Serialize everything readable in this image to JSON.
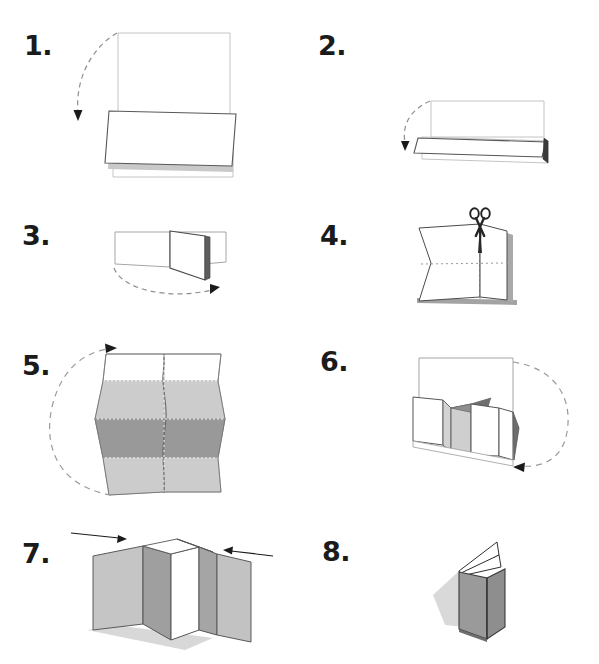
{
  "document": {
    "kind": "illustrated-instruction-sheet",
    "title": "Paper folding instructions",
    "subject": "folded-book-from-single-sheet",
    "background_color": "#ffffff",
    "total_steps": 8,
    "columns": 2,
    "rows": 4
  },
  "palette": {
    "ink": "#1b1b1b",
    "outline": "#4a4a4a",
    "outline_light": "#9b9b9b",
    "paper_face": "#ffffff",
    "paper_light_gray": "#cccccc",
    "paper_mid_gray": "#b0b0b0",
    "paper_dark_gray": "#999999",
    "paper_shadow_gray": "#8c8c8c",
    "drop_shadow": "#c8c8c8",
    "fold_line": "#9a9a9a",
    "arrow": "#5a5a5a",
    "arrow_solid": "#1b1b1b"
  },
  "steps": [
    {
      "number": "1.",
      "number_position": {
        "x": 24,
        "y": 32
      },
      "figure_position": {
        "x": 60,
        "y": 22
      },
      "action": "fold-sheet-in-half-downward",
      "description": "Fold the upright sheet forward and down along the horizontal middle.",
      "arrow": {
        "type": "curved-dashed",
        "direction": "down-left",
        "style": "dashed"
      },
      "icons": [
        "curved-fold-arrow-icon",
        "paper-sheet-icon"
      ]
    },
    {
      "number": "2.",
      "number_position": {
        "x": 318,
        "y": 32
      },
      "figure_position": {
        "x": 360,
        "y": 22
      },
      "action": "fold-in-half-downward-again",
      "description": "Fold the resulting rectangle forward and down in half again.",
      "arrow": {
        "type": "curved-dashed",
        "direction": "down-left",
        "style": "dashed"
      },
      "icons": [
        "curved-fold-arrow-icon",
        "paper-sheet-icon"
      ]
    },
    {
      "number": "3.",
      "number_position": {
        "x": 22,
        "y": 222
      },
      "figure_position": {
        "x": 60,
        "y": 210
      },
      "action": "fold-right-half-to-the-right",
      "description": "Fold the standing half over sideways to the right.",
      "arrow": {
        "type": "curved-dashed",
        "direction": "right",
        "style": "dashed"
      },
      "icons": [
        "curved-fold-arrow-icon",
        "paper-sheet-icon"
      ]
    },
    {
      "number": "4.",
      "number_position": {
        "x": 320,
        "y": 222
      },
      "figure_position": {
        "x": 360,
        "y": 210
      },
      "action": "cut-along-center-fold",
      "description": "Unfold part way and cut along the centre crease with scissors.",
      "arrow": {
        "type": "none"
      },
      "fold_lines": "dotted crease lines along horizontal middle and vertical middle",
      "icons": [
        "scissors-icon",
        "dotted-fold-line-icon",
        "paper-sheet-icon"
      ]
    },
    {
      "number": "5.",
      "number_position": {
        "x": 22,
        "y": 352
      },
      "figure_position": {
        "x": 55,
        "y": 338
      },
      "action": "open-into-accordion-pleats",
      "description": "Open the cut sheet out into an accordion of pleats and rotate it.",
      "arrow": {
        "type": "curved-dashed-large",
        "direction": "counter-clockwise-up",
        "style": "dashed"
      },
      "icons": [
        "curved-rotate-arrow-icon",
        "accordion-pleat-icon"
      ]
    },
    {
      "number": "6.",
      "number_position": {
        "x": 320,
        "y": 348
      },
      "figure_position": {
        "x": 345,
        "y": 335
      },
      "action": "rotate-and-stand-pleats-upright",
      "description": "Stand the pleated paper up and swing it around.",
      "arrow": {
        "type": "curved-dashed-large",
        "direction": "clockwise-down",
        "style": "dashed"
      },
      "icons": [
        "curved-rotate-arrow-icon",
        "pleated-paper-icon"
      ]
    },
    {
      "number": "7.",
      "number_position": {
        "x": 22,
        "y": 540
      },
      "figure_position": {
        "x": 70,
        "y": 522
      },
      "action": "push-outer-panels-together",
      "description": "Push the two outer panels toward each other to close the pleats.",
      "arrow": {
        "type": "straight-pair",
        "direction": "inward",
        "style": "solid"
      },
      "icons": [
        "arrow-right-icon",
        "arrow-left-icon",
        "standing-pleats-icon"
      ]
    },
    {
      "number": "8.",
      "number_position": {
        "x": 322,
        "y": 538
      },
      "figure_position": {
        "x": 430,
        "y": 528
      },
      "action": "finished-folded-booklet",
      "description": "The finished little booklet stands on its own.",
      "arrow": {
        "type": "none"
      },
      "icons": [
        "folded-booklet-icon"
      ]
    }
  ]
}
